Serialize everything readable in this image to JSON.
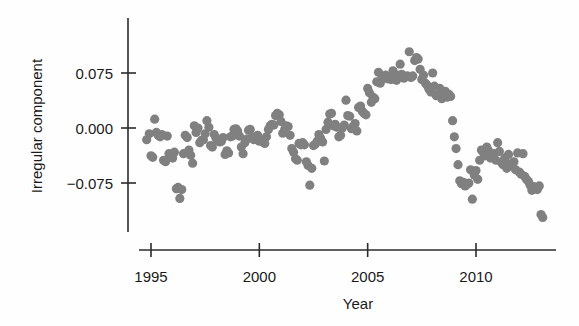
{
  "chart_data": {
    "type": "scatter",
    "title": "",
    "subtitle": "",
    "xlabel": "Year",
    "ylabel": "Irregular component",
    "xlim": [
      1994.3,
      2013.3
    ],
    "ylim": [
      -0.135,
      0.125
    ],
    "xticks": [
      1995,
      2000,
      2005,
      2010
    ],
    "xtick_labels": [
      "1995",
      "2000",
      "2005",
      "2010"
    ],
    "yticks": [
      0.075,
      0.0,
      -0.075
    ],
    "ytick_labels": [
      "0.075",
      "0.000",
      "-0.075"
    ],
    "grid": false,
    "legend": "none",
    "marker_color": "#808080",
    "marker_size": 4.6,
    "axis_color": "#2b2b2b",
    "series": [
      {
        "name": "Irregular component",
        "points": [
          [
            1994.8,
            -0.016
          ],
          [
            1994.92,
            -0.008
          ],
          [
            1995.0,
            -0.038
          ],
          [
            1995.08,
            -0.04
          ],
          [
            1995.17,
            0.012
          ],
          [
            1995.25,
            -0.006
          ],
          [
            1995.33,
            -0.01
          ],
          [
            1995.42,
            -0.012
          ],
          [
            1995.5,
            -0.009
          ],
          [
            1995.58,
            -0.044
          ],
          [
            1995.67,
            -0.046
          ],
          [
            1995.75,
            -0.011
          ],
          [
            1995.83,
            -0.035
          ],
          [
            1995.92,
            -0.038
          ],
          [
            1996.0,
            -0.041
          ],
          [
            1996.08,
            -0.033
          ],
          [
            1996.17,
            -0.083
          ],
          [
            1996.25,
            -0.081
          ],
          [
            1996.33,
            -0.096
          ],
          [
            1996.42,
            -0.084
          ],
          [
            1996.5,
            -0.035
          ],
          [
            1996.58,
            -0.01
          ],
          [
            1996.67,
            -0.013
          ],
          [
            1996.75,
            -0.03
          ],
          [
            1996.83,
            -0.037
          ],
          [
            1996.92,
            -0.048
          ],
          [
            1997.0,
            0.003
          ],
          [
            1997.08,
            -0.006
          ],
          [
            1997.17,
            0.0
          ],
          [
            1997.25,
            -0.02
          ],
          [
            1997.33,
            -0.017
          ],
          [
            1997.42,
            -0.016
          ],
          [
            1997.5,
            -0.008
          ],
          [
            1997.58,
            0.01
          ],
          [
            1997.67,
            0.001
          ],
          [
            1997.75,
            -0.024
          ],
          [
            1997.83,
            -0.026
          ],
          [
            1997.92,
            -0.009
          ],
          [
            1998.0,
            -0.014
          ],
          [
            1998.08,
            -0.017
          ],
          [
            1998.17,
            -0.019
          ],
          [
            1998.25,
            -0.018
          ],
          [
            1998.33,
            -0.013
          ],
          [
            1998.42,
            -0.036
          ],
          [
            1998.5,
            -0.031
          ],
          [
            1998.58,
            -0.034
          ],
          [
            1998.67,
            -0.012
          ],
          [
            1998.75,
            -0.011
          ],
          [
            1998.83,
            -0.002
          ],
          [
            1998.92,
            -0.001
          ],
          [
            1999.0,
            -0.004
          ],
          [
            1999.08,
            -0.011
          ],
          [
            1999.17,
            -0.026
          ],
          [
            1999.25,
            -0.035
          ],
          [
            1999.33,
            -0.02
          ],
          [
            1999.42,
            -0.015
          ],
          [
            1999.5,
            -0.003
          ],
          [
            1999.58,
            -0.002
          ],
          [
            1999.67,
            -0.012
          ],
          [
            1999.75,
            -0.016
          ],
          [
            1999.83,
            -0.013
          ],
          [
            1999.92,
            -0.01
          ],
          [
            2000.0,
            -0.018
          ],
          [
            2000.08,
            -0.017
          ],
          [
            2000.17,
            -0.019
          ],
          [
            2000.25,
            -0.021
          ],
          [
            2000.33,
            -0.012
          ],
          [
            2000.42,
            -0.002
          ],
          [
            2000.5,
            0.003
          ],
          [
            2000.58,
            0.005
          ],
          [
            2000.67,
            0.004
          ],
          [
            2000.75,
            0.017
          ],
          [
            2000.83,
            0.02
          ],
          [
            2000.92,
            0.018
          ],
          [
            2001.0,
            0.009
          ],
          [
            2001.08,
            -0.007
          ],
          [
            2001.17,
            -0.002
          ],
          [
            2001.25,
            0.003
          ],
          [
            2001.33,
            0.002
          ],
          [
            2001.42,
            -0.01
          ],
          [
            2001.5,
            -0.028
          ],
          [
            2001.58,
            -0.033
          ],
          [
            2001.67,
            -0.042
          ],
          [
            2001.75,
            -0.044
          ],
          [
            2001.83,
            -0.021
          ],
          [
            2001.92,
            -0.023
          ],
          [
            2002.0,
            -0.02
          ],
          [
            2002.08,
            -0.023
          ],
          [
            2002.17,
            -0.046
          ],
          [
            2002.25,
            -0.051
          ],
          [
            2002.33,
            -0.078
          ],
          [
            2002.42,
            -0.055
          ],
          [
            2002.5,
            -0.024
          ],
          [
            2002.58,
            -0.022
          ],
          [
            2002.67,
            -0.018
          ],
          [
            2002.75,
            -0.009
          ],
          [
            2002.83,
            -0.014
          ],
          [
            2002.92,
            -0.019
          ],
          [
            2003.0,
            -0.045
          ],
          [
            2003.08,
            -0.002
          ],
          [
            2003.17,
            0.008
          ],
          [
            2003.25,
            0.019
          ],
          [
            2003.33,
            0.02
          ],
          [
            2003.42,
            0.003
          ],
          [
            2003.5,
            0.005
          ],
          [
            2003.58,
            0.001
          ],
          [
            2003.67,
            -0.012
          ],
          [
            2003.75,
            -0.01
          ],
          [
            2003.83,
            0.0
          ],
          [
            2003.92,
            0.004
          ],
          [
            2004.0,
            0.038
          ],
          [
            2004.08,
            0.017
          ],
          [
            2004.17,
            0.016
          ],
          [
            2004.25,
            -0.001
          ],
          [
            2004.33,
            0.002
          ],
          [
            2004.42,
            0.006
          ],
          [
            2004.5,
            -0.004
          ],
          [
            2004.58,
            0.028
          ],
          [
            2004.67,
            0.03
          ],
          [
            2004.75,
            0.023
          ],
          [
            2004.83,
            0.02
          ],
          [
            2004.92,
            0.018
          ],
          [
            2005.0,
            0.054
          ],
          [
            2005.08,
            0.048
          ],
          [
            2005.17,
            0.035
          ],
          [
            2005.25,
            0.042
          ],
          [
            2005.33,
            0.04
          ],
          [
            2005.42,
            0.063
          ],
          [
            2005.5,
            0.076
          ],
          [
            2005.58,
            0.061
          ],
          [
            2005.67,
            0.07
          ],
          [
            2005.75,
            0.068
          ],
          [
            2005.83,
            0.072
          ],
          [
            2005.92,
            0.067
          ],
          [
            2006.0,
            0.069
          ],
          [
            2006.08,
            0.066
          ],
          [
            2006.17,
            0.078
          ],
          [
            2006.25,
            0.07
          ],
          [
            2006.33,
            0.065
          ],
          [
            2006.42,
            0.072
          ],
          [
            2006.5,
            0.087
          ],
          [
            2006.58,
            0.073
          ],
          [
            2006.67,
            0.068
          ],
          [
            2006.75,
            0.07
          ],
          [
            2006.83,
            0.071
          ],
          [
            2006.92,
            0.104
          ],
          [
            2007.0,
            0.069
          ],
          [
            2007.08,
            0.071
          ],
          [
            2007.17,
            0.092
          ],
          [
            2007.25,
            0.096
          ],
          [
            2007.33,
            0.094
          ],
          [
            2007.42,
            0.08
          ],
          [
            2007.5,
            0.066
          ],
          [
            2007.58,
            0.072
          ],
          [
            2007.67,
            0.061
          ],
          [
            2007.75,
            0.058
          ],
          [
            2007.83,
            0.053
          ],
          [
            2007.92,
            0.049
          ],
          [
            2008.0,
            0.075
          ],
          [
            2008.08,
            0.057
          ],
          [
            2008.17,
            0.044
          ],
          [
            2008.25,
            0.046
          ],
          [
            2008.33,
            0.054
          ],
          [
            2008.42,
            0.04
          ],
          [
            2008.5,
            0.043
          ],
          [
            2008.58,
            0.05
          ],
          [
            2008.67,
            0.042
          ],
          [
            2008.75,
            0.046
          ],
          [
            2008.83,
            0.043
          ],
          [
            2008.92,
            0.01
          ],
          [
            2009.0,
            -0.012
          ],
          [
            2009.08,
            -0.028
          ],
          [
            2009.17,
            -0.05
          ],
          [
            2009.25,
            -0.072
          ],
          [
            2009.33,
            -0.076
          ],
          [
            2009.42,
            -0.074
          ],
          [
            2009.5,
            -0.079
          ],
          [
            2009.58,
            -0.077
          ],
          [
            2009.67,
            -0.075
          ],
          [
            2009.75,
            -0.057
          ],
          [
            2009.83,
            -0.097
          ],
          [
            2009.92,
            -0.064
          ],
          [
            2010.0,
            -0.058
          ],
          [
            2010.08,
            -0.07
          ],
          [
            2010.17,
            -0.044
          ],
          [
            2010.25,
            -0.03
          ],
          [
            2010.33,
            -0.033
          ],
          [
            2010.42,
            -0.038
          ],
          [
            2010.5,
            -0.026
          ],
          [
            2010.58,
            -0.031
          ],
          [
            2010.67,
            -0.041
          ],
          [
            2010.75,
            -0.037
          ],
          [
            2010.83,
            -0.035
          ],
          [
            2010.92,
            -0.044
          ],
          [
            2011.0,
            -0.02
          ],
          [
            2011.08,
            -0.032
          ],
          [
            2011.17,
            -0.047
          ],
          [
            2011.25,
            -0.05
          ],
          [
            2011.33,
            -0.041
          ],
          [
            2011.42,
            -0.055
          ],
          [
            2011.5,
            -0.036
          ],
          [
            2011.58,
            -0.049
          ],
          [
            2011.67,
            -0.052
          ],
          [
            2011.75,
            -0.046
          ],
          [
            2011.83,
            -0.057
          ],
          [
            2011.92,
            -0.034
          ],
          [
            2012.0,
            -0.06
          ],
          [
            2012.08,
            -0.063
          ],
          [
            2012.17,
            -0.035
          ],
          [
            2012.25,
            -0.066
          ],
          [
            2012.33,
            -0.07
          ],
          [
            2012.42,
            -0.073
          ],
          [
            2012.5,
            -0.078
          ],
          [
            2012.58,
            -0.085
          ],
          [
            2012.67,
            -0.08
          ],
          [
            2012.75,
            -0.082
          ],
          [
            2012.83,
            -0.084
          ],
          [
            2012.92,
            -0.079
          ],
          [
            2013.0,
            -0.118
          ],
          [
            2013.08,
            -0.122
          ]
        ]
      }
    ]
  }
}
